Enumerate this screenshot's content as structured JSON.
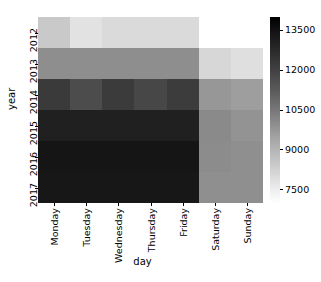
{
  "chart_data": {
    "type": "heatmap",
    "title": "",
    "xlabel": "day",
    "ylabel": "year",
    "categories_x": [
      "Monday",
      "Tuesday",
      "Wednesday",
      "Thursday",
      "Friday",
      "Saturday",
      "Sunday"
    ],
    "categories_y": [
      "2012",
      "2013",
      "2014",
      "2015",
      "2016",
      "2017"
    ],
    "colormap": "Greys",
    "colorbar": {
      "ticks": [
        "13500",
        "12000",
        "10500",
        "9000",
        "7500"
      ],
      "tick_values": [
        13500,
        12000,
        10500,
        9000,
        7500
      ],
      "position": "right",
      "vmin": 7000,
      "vmax": 14000,
      "orientation": "vertical",
      "high_is_dark": true
    },
    "grid": false,
    "axis_ranges": {
      "x": [
        0,
        7
      ],
      "y": [
        0,
        6
      ]
    },
    "values": [
      [
        9100,
        8200,
        8500,
        8500,
        8500,
        null,
        null
      ],
      [
        11300,
        11300,
        11300,
        11300,
        11300,
        8700,
        8400
      ],
      [
        13300,
        12600,
        13300,
        12800,
        13200,
        10700,
        10400
      ],
      [
        13700,
        13700,
        13700,
        13700,
        13700,
        11100,
        10600
      ],
      [
        13950,
        13950,
        13950,
        13950,
        13950,
        11000,
        10800
      ],
      [
        13900,
        13900,
        13900,
        13900,
        13900,
        10900,
        10900
      ]
    ],
    "cell_colors": [
      [
        "#c9c9c9",
        "#e2e2e2",
        "#dadada",
        "#dadada",
        "#dadada",
        "#ffffff",
        "#ffffff"
      ],
      [
        "#8e8e8e",
        "#8e8e8e",
        "#8e8e8e",
        "#8e8e8e",
        "#8e8e8e",
        "#d7d7d7",
        "#dfdfdf"
      ],
      [
        "#3a3a3a",
        "#4c4c4c",
        "#3b3b3b",
        "#474747",
        "#3c3c3c",
        "#979797",
        "#9e9e9e"
      ],
      [
        "#202020",
        "#202020",
        "#202020",
        "#202020",
        "#202020",
        "#8a8a8a",
        "#939393"
      ],
      [
        "#151515",
        "#151515",
        "#151515",
        "#151515",
        "#151515",
        "#8c8c8c",
        "#8f8f8f"
      ],
      [
        "#171717",
        "#171717",
        "#171717",
        "#171717",
        "#171717",
        "#8f8f8f",
        "#8f8f8f"
      ]
    ],
    "missing_cells": [
      [
        0,
        5
      ],
      [
        0,
        6
      ]
    ]
  },
  "axes": {
    "y_title": "year",
    "x_title": "day"
  },
  "colorbar_labels": {
    "t0": "13500",
    "t1": "12000",
    "t2": "10500",
    "t3": "9000",
    "t4": "7500"
  }
}
